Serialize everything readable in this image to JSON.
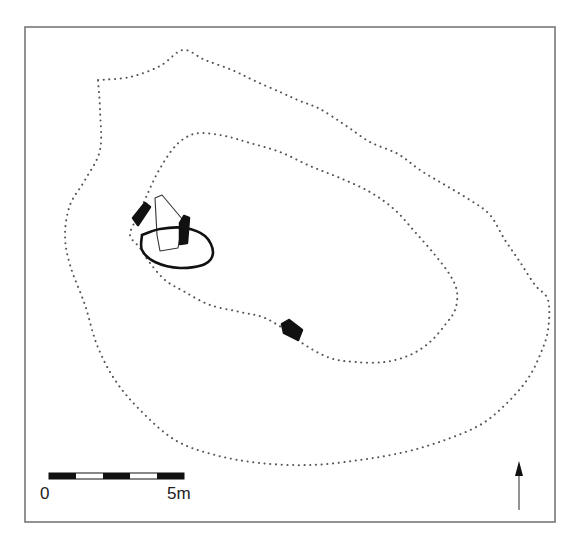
{
  "figure": {
    "type": "archaeological site plan",
    "frame": {
      "x": 25,
      "y": 27,
      "width": 530,
      "height": 495,
      "stroke": "#777777"
    },
    "contours": [
      {
        "name": "outer-contour",
        "style": "dotted",
        "color": "#555555",
        "points": [
          [
            98,
            80
          ],
          [
            130,
            77
          ],
          [
            160,
            66
          ],
          [
            183,
            50
          ],
          [
            205,
            60
          ],
          [
            232,
            70
          ],
          [
            255,
            81
          ],
          [
            280,
            92
          ],
          [
            300,
            101
          ],
          [
            320,
            109
          ],
          [
            345,
            125
          ],
          [
            370,
            142
          ],
          [
            398,
            154
          ],
          [
            420,
            170
          ],
          [
            445,
            185
          ],
          [
            470,
            200
          ],
          [
            490,
            215
          ],
          [
            505,
            240
          ],
          [
            520,
            262
          ],
          [
            535,
            285
          ],
          [
            548,
            300
          ],
          [
            548,
            330
          ],
          [
            540,
            355
          ],
          [
            527,
            380
          ],
          [
            505,
            405
          ],
          [
            480,
            425
          ],
          [
            445,
            440
          ],
          [
            405,
            452
          ],
          [
            360,
            460
          ],
          [
            310,
            465
          ],
          [
            260,
            463
          ],
          [
            215,
            455
          ],
          [
            175,
            440
          ],
          [
            140,
            410
          ],
          [
            115,
            380
          ],
          [
            97,
            345
          ],
          [
            85,
            305
          ],
          [
            70,
            265
          ],
          [
            65,
            235
          ],
          [
            70,
            205
          ],
          [
            85,
            180
          ],
          [
            100,
            150
          ],
          [
            100,
            110
          ],
          [
            98,
            80
          ]
        ]
      },
      {
        "name": "inner-contour",
        "style": "dotted",
        "color": "#555555",
        "points": [
          [
            137,
            218
          ],
          [
            147,
            195
          ],
          [
            158,
            172
          ],
          [
            172,
            150
          ],
          [
            185,
            138
          ],
          [
            200,
            133
          ],
          [
            225,
            136
          ],
          [
            250,
            143
          ],
          [
            280,
            152
          ],
          [
            310,
            166
          ],
          [
            340,
            178
          ],
          [
            370,
            192
          ],
          [
            395,
            210
          ],
          [
            415,
            232
          ],
          [
            435,
            255
          ],
          [
            450,
            275
          ],
          [
            457,
            292
          ],
          [
            455,
            310
          ],
          [
            445,
            325
          ],
          [
            430,
            342
          ],
          [
            410,
            355
          ],
          [
            385,
            362
          ],
          [
            355,
            362
          ],
          [
            330,
            358
          ],
          [
            305,
            345
          ],
          [
            290,
            333
          ],
          [
            265,
            318
          ],
          [
            240,
            312
          ],
          [
            210,
            305
          ],
          [
            185,
            292
          ],
          [
            165,
            280
          ],
          [
            150,
            263
          ],
          [
            140,
            248
          ],
          [
            130,
            235
          ],
          [
            137,
            218
          ]
        ]
      }
    ],
    "features": [
      {
        "name": "thin-outline-stone",
        "style": "thin-outline",
        "points": [
          [
            155,
            198
          ],
          [
            162,
            195
          ],
          [
            183,
            220
          ],
          [
            178,
            248
          ],
          [
            160,
            251
          ],
          [
            157,
            235
          ],
          [
            155,
            198
          ]
        ]
      },
      {
        "name": "thick-outline-setting",
        "style": "thick-outline",
        "points": [
          [
            142,
            235
          ],
          [
            160,
            229
          ],
          [
            185,
            228
          ],
          [
            205,
            236
          ],
          [
            213,
            252
          ],
          [
            205,
            264
          ],
          [
            180,
            268
          ],
          [
            155,
            262
          ],
          [
            142,
            250
          ],
          [
            142,
            235
          ]
        ]
      },
      {
        "name": "black-stone-west",
        "style": "filled",
        "points": [
          [
            133,
            218
          ],
          [
            145,
            203
          ],
          [
            150,
            207
          ],
          [
            138,
            225
          ]
        ]
      },
      {
        "name": "black-stone-east",
        "style": "filled",
        "points": [
          [
            180,
            223
          ],
          [
            184,
            216
          ],
          [
            189,
            218
          ],
          [
            187,
            243
          ],
          [
            180,
            244
          ]
        ]
      },
      {
        "name": "black-stone-south",
        "style": "filled",
        "points": [
          [
            282,
            324
          ],
          [
            289,
            320
          ],
          [
            302,
            330
          ],
          [
            298,
            340
          ],
          [
            284,
            333
          ]
        ]
      }
    ]
  },
  "scale_bar": {
    "x": 49,
    "y": 473,
    "width": 135,
    "height": 6,
    "segments": [
      "black",
      "white",
      "black",
      "white",
      "black"
    ],
    "label_start": "0",
    "label_end": "5m"
  },
  "north_arrow": {
    "x": 519,
    "top": 461,
    "bottom": 510,
    "label": ""
  },
  "caption": {
    "visible_text": ""
  }
}
